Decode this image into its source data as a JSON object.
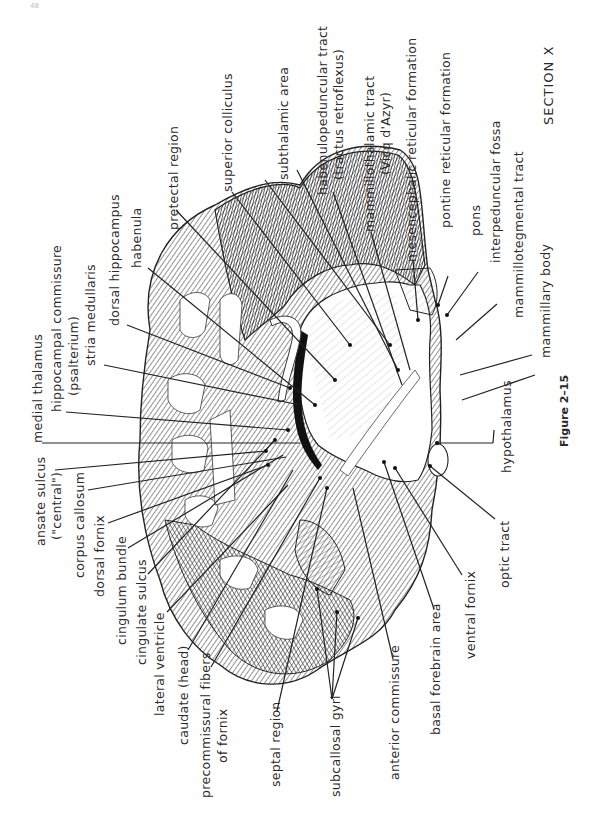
{
  "page_number": "48",
  "section_title": "SECTION X",
  "figure_caption": "Figure 2–15",
  "labels": {
    "medial_thalamus": "medial thalamus",
    "hippocampal_commissure": "hippocampal commissure",
    "psalterium": "(psalterium)",
    "stria_medullaris": "stria medullaris",
    "dorsal_hippocampus": "dorsal hippocampus",
    "habenula": "habenula",
    "pretectal_region": "pretectal  region",
    "superior_colliculus": "superior colliculus",
    "subthalamic_area": "subthalamic area",
    "habenulopeduncular_tract": "habenulopeduncular tract",
    "tractus_retroflexus": "(tractus retroflexus)",
    "mammillothalamic_tract": "mammillothalamic tract",
    "vicq_dazyr": "(Vicq d'Azyr)",
    "mesencephalic_reticular_formation": "mesencephalic reticular formation",
    "pontine_reticular_formation": "pontine reticular formation",
    "pons": "pons",
    "interpeduncular_fossa": "interpeduncular fossa",
    "mammillotegmental_tract": "mammillotegmental tract",
    "mammillary_body": "mammillary body",
    "hypothalamus": "hypothalamus",
    "optic_tract": "optic tract",
    "ventral_fornix": "ventral fornix",
    "basal_forebrain_area": "basal forebrain area",
    "anterior_commissure": "anterior commissure",
    "subcallosal_gyri": "subcallosal gyri",
    "septal_region": "septal region",
    "precommissural_fibers": "precommissural fibers",
    "of_fornix": "of fornix",
    "caudate_head": "caudate (head)",
    "lateral_ventricle": "lateral  ventricle",
    "cingulate_sulcus": "cingulate sulcus",
    "cingulum_bundle": "cingulum bundle",
    "dorsal_fornix": "dorsal fornix",
    "corpus_callosum": "corpus callosum",
    "ansate_sulcus": "ansate sulcus",
    "central": "(\"central\")"
  }
}
